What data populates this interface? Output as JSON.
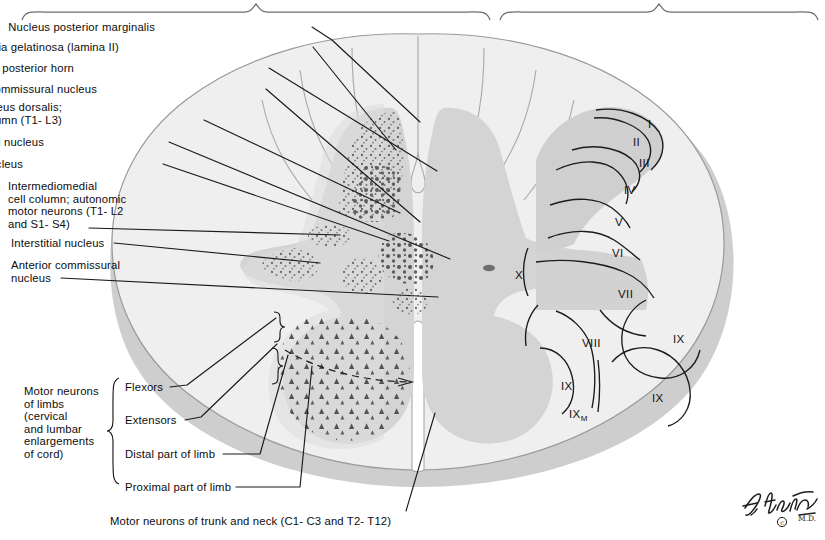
{
  "figure": {
    "signature": "F. Netter",
    "signature_suffix": "M.D.",
    "copyright_glyph": "©"
  },
  "colors": {
    "white_matter": "#eeeeee",
    "gray_matter": "#d2d2d2",
    "gray_matter_light": "#dedede",
    "lamina_shade": "#c8c8c8",
    "outline": "#8a8a8a",
    "stipple": "#5a5a5a",
    "neuron": "#4a4a4a",
    "leader": "#1a1a1a",
    "text": "#0d0d0d",
    "shadow": "#b9b9b9"
  },
  "left_labels": [
    {
      "id": "nucleus-posterior-marginalis",
      "text": "Nucleus posterior marginalis",
      "x": 155,
      "y": 21,
      "align": "right",
      "leader": [
        [
          312,
          27
        ],
        [
          332,
          40
        ],
        [
          420,
          122
        ]
      ]
    },
    {
      "id": "substantia-gelatinosa",
      "text": "Substantia gelatinosa (lamina II)",
      "x": 119,
      "y": 41,
      "align": "right",
      "leader": [
        [
          313,
          47
        ],
        [
          396,
          150
        ]
      ]
    },
    {
      "id": "nucleus-proprius-posterior-horn",
      "text": "Nucleus proprius of posterior horn",
      "x": 74,
      "y": 62,
      "align": "right",
      "leader": [
        [
          269,
          68
        ],
        [
          437,
          171
        ]
      ]
    },
    {
      "id": "posterior-commissural-nucleus",
      "text": "Posterior commissural nucleus",
      "x": 97,
      "y": 83,
      "align": "right",
      "leader": [
        [
          266,
          89
        ],
        [
          420,
          222
        ]
      ]
    },
    {
      "id": "nucleus-dorsalis-clarkes-column",
      "text": "Nucleus dorsalis;\nClarke's column (T1- L3)",
      "x": 62,
      "y": 101,
      "align": "right",
      "leader": [
        [
          204,
          120
        ],
        [
          400,
          213
        ]
      ]
    },
    {
      "id": "lateral-basal-nucleus",
      "text": "Lateral basal nucleus",
      "x": 44,
      "y": 136,
      "align": "right",
      "leader": [
        [
          169,
          142
        ],
        [
          450,
          259
        ]
      ]
    },
    {
      "id": "spinal-reticular-nucleus",
      "text": "Spinal reticular nucleus",
      "x": 23,
      "y": 158,
      "align": "right",
      "leader": [
        [
          163,
          164
        ],
        [
          389,
          241
        ]
      ]
    },
    {
      "id": "intermediomedial-cell-column",
      "text": "Intermediomedial\ncell column; autonomic\nmotor neurons (T1- L2\nand S1- S4)",
      "x": 8,
      "y": 180,
      "align": "left",
      "leader": [
        [
          89,
          228
        ],
        [
          340,
          235
        ]
      ]
    },
    {
      "id": "interstitial-nucleus",
      "text": "Interstitial nucleus",
      "x": 11,
      "y": 237,
      "align": "left",
      "leader": [
        [
          114,
          243
        ],
        [
          320,
          263
        ]
      ]
    },
    {
      "id": "anterior-commissural-nucleus",
      "text": "Anterior commissural\nnucleus",
      "x": 11,
      "y": 259,
      "align": "left",
      "leader": [
        [
          61,
          278
        ],
        [
          438,
          297
        ]
      ]
    }
  ],
  "limb_group": {
    "id": "motor-neurons-of-limbs",
    "text": "Motor neurons\nof limbs\n(cervical\nand lumbar\nenlargements\nof cord)",
    "x": 24,
    "y": 385,
    "brace": {
      "x": 110,
      "y0": 378,
      "y1": 484
    },
    "items": [
      {
        "id": "flexors",
        "text": "Flexors",
        "x": 125,
        "y": 381,
        "leader": [
          [
            170,
            387
          ],
          [
            187,
            385
          ],
          [
            276,
            318
          ]
        ]
      },
      {
        "id": "extensors",
        "text": "Extensors",
        "x": 125,
        "y": 414,
        "leader": [
          [
            185,
            420
          ],
          [
            201,
            417
          ],
          [
            277,
            344
          ]
        ]
      },
      {
        "id": "distal-part-of-limb",
        "text": "Distal part of limb",
        "x": 125,
        "y": 448,
        "leader": [
          [
            223,
            454
          ],
          [
            260,
            454
          ],
          [
            288,
            355
          ]
        ]
      },
      {
        "id": "proximal-part-of-limb",
        "text": "Proximal part of limb",
        "x": 125,
        "y": 481,
        "leader": [
          [
            236,
            487
          ],
          [
            300,
            487
          ],
          [
            312,
            366
          ]
        ]
      }
    ]
  },
  "bottom_label": {
    "id": "motor-neurons-trunk-and-neck",
    "text": "Motor neurons of trunk and neck (C1- C3 and T2- T12)",
    "x": 110,
    "y": 515,
    "leader": [
      [
        406,
        511
      ],
      [
        435,
        413
      ]
    ]
  },
  "laminae": [
    {
      "id": "lamina-I",
      "label": "I",
      "x": 648,
      "y": 118
    },
    {
      "id": "lamina-II",
      "label": "II",
      "x": 633,
      "y": 136
    },
    {
      "id": "lamina-III",
      "label": "III",
      "x": 639,
      "y": 157
    },
    {
      "id": "lamina-IV",
      "label": "IV",
      "x": 624,
      "y": 184
    },
    {
      "id": "lamina-V",
      "label": "V",
      "x": 615,
      "y": 216
    },
    {
      "id": "lamina-VI",
      "label": "VI",
      "x": 612,
      "y": 247
    },
    {
      "id": "lamina-VII",
      "label": "VII",
      "x": 618,
      "y": 288
    },
    {
      "id": "lamina-VIII",
      "label": "VIII",
      "x": 582,
      "y": 337
    },
    {
      "id": "lamina-IX-lateral",
      "label": "IX",
      "x": 673,
      "y": 333
    },
    {
      "id": "lamina-IX-medial",
      "label": "IX",
      "x": 561,
      "y": 380
    },
    {
      "id": "lamina-IX-ventrolateral",
      "label": "IX",
      "x": 652,
      "y": 392
    },
    {
      "id": "lamina-X",
      "label": "X",
      "x": 515,
      "y": 269
    }
  ],
  "lamina_IX_m": {
    "id": "lamina-IX-M",
    "label": "IX",
    "sub": "M",
    "x": 569,
    "y": 408
  },
  "top_braces": [
    {
      "id": "top-brace-left",
      "x0": 22,
      "x1": 490,
      "y": 8
    },
    {
      "id": "top-brace-right",
      "x0": 500,
      "x1": 818,
      "y": 8
    }
  ]
}
